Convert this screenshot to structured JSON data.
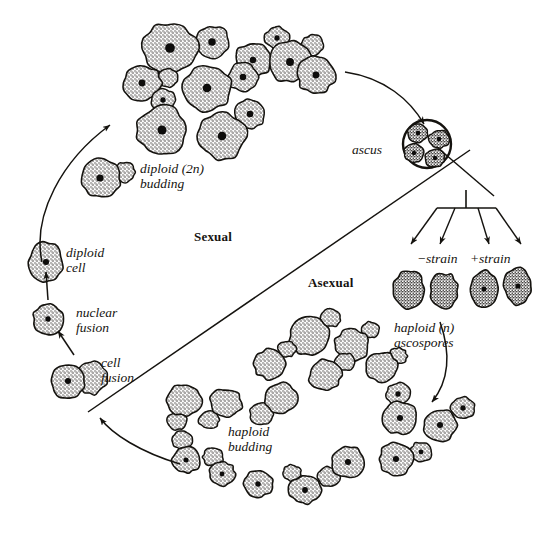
{
  "figure": {
    "background_color": "#ffffff",
    "ink_color": "#15130f",
    "cell_fill_color": "#c9c5bd",
    "nucleus_color": "#111111"
  },
  "labels": {
    "diploid_budding": "diploid (2n)\nbudding",
    "sexual": "Sexual",
    "asexual": "Asexual",
    "diploid_cell": "diploid\ncell",
    "nuclear_fusion": "nuclear\nfusion",
    "cell_fusion": "cell\nfusion",
    "ascus": "ascus",
    "minus_strain": "−strain",
    "plus_strain": "+strain",
    "haploid_ascospores": "haploid (n)\nascospores",
    "haploid_budding": "haploid\nbudding"
  },
  "label_positions": {
    "diploid_budding": {
      "x": 140,
      "y": 161
    },
    "sexual": {
      "x": 194,
      "y": 230
    },
    "asexual": {
      "x": 308,
      "y": 276
    },
    "diploid_cell": {
      "x": 66,
      "y": 245
    },
    "nuclear_fusion": {
      "x": 76,
      "y": 305
    },
    "cell_fusion": {
      "x": 101,
      "y": 355
    },
    "ascus": {
      "x": 352,
      "y": 142
    },
    "minus_strain": {
      "x": 417,
      "y": 251
    },
    "plus_strain": {
      "x": 470,
      "y": 251
    },
    "haploid_ascospores": {
      "x": 394,
      "y": 320
    },
    "haploid_budding": {
      "x": 228,
      "y": 424
    }
  },
  "divider": {
    "name": "sexual-asexual-divider",
    "from": {
      "x": 88,
      "y": 412
    },
    "to": {
      "x": 470,
      "y": 150
    }
  },
  "secondary_divider": {
    "name": "strain-divider-line",
    "from": {
      "x": 438,
      "y": 148
    },
    "to": {
      "x": 494,
      "y": 196
    }
  },
  "arrows": [
    {
      "name": "arrow-diploid-cell-to-diploid-budding",
      "d": "M 42 262 C 32 215 62 160 110 125",
      "direction": "up-right"
    },
    {
      "name": "arrow-nuclear-fusion-to-diploid-cell",
      "d": "M 48 300 L 46 272",
      "direction": "up"
    },
    {
      "name": "arrow-cell-fusion-to-nuclear-fusion",
      "d": "M 74 355 L 58 331",
      "direction": "up-left"
    },
    {
      "name": "arrow-diploid-cell-to-ascus",
      "d": "M 345 72 C 385 78 410 100 424 124",
      "direction": "down-right"
    },
    {
      "name": "arrow-haploid-budding-to-cell-fusion",
      "d": "M 180 464 C 140 452 112 434 100 418",
      "direction": "up-left"
    },
    {
      "name": "arrow-ascospores-to-haploid-budding",
      "d": "M 440 322 C 452 356 448 382 432 402",
      "direction": "down-left"
    }
  ],
  "spore_fan": {
    "name": "ascospore-release-bracket",
    "bar": {
      "x1": 437,
      "y1": 208,
      "x2": 496,
      "y2": 208
    },
    "stem": {
      "x1": 466,
      "y1": 208,
      "x2": 466,
      "y2": 190
    },
    "arrows": [
      {
        "name": "fan-arrow-1",
        "x1": 437,
        "y1": 208,
        "x2": 411,
        "y2": 244
      },
      {
        "name": "fan-arrow-2",
        "x1": 455,
        "y1": 208,
        "x2": 440,
        "y2": 244
      },
      {
        "name": "fan-arrow-3",
        "x1": 478,
        "y1": 208,
        "x2": 489,
        "y2": 244
      },
      {
        "name": "fan-arrow-4",
        "x1": 496,
        "y1": 208,
        "x2": 521,
        "y2": 244
      }
    ]
  },
  "cell_groups": {
    "diploid_budding_cluster": {
      "name": "diploid-budding-cells",
      "ploidy": "2n",
      "cells": [
        {
          "cx": 170,
          "cy": 48,
          "rx": 27,
          "ry": 25,
          "nucleus": true,
          "bud": {
            "cx": 212,
            "cy": 42,
            "rx": 17,
            "ry": 16,
            "nucleus": true
          }
        },
        {
          "cx": 253,
          "cy": 60,
          "rx": 18,
          "ry": 17,
          "nucleus": true,
          "bud": {
            "cx": 277,
            "cy": 38,
            "rx": 12,
            "ry": 11,
            "nucleus": true
          }
        },
        {
          "cx": 142,
          "cy": 83,
          "rx": 19,
          "ry": 18,
          "nucleus": true,
          "bud": {
            "cx": 168,
            "cy": 78,
            "rx": 10,
            "ry": 9,
            "nucleus": false
          }
        },
        {
          "cx": 207,
          "cy": 88,
          "rx": 24,
          "ry": 23,
          "nucleus": true,
          "bud": {
            "cx": 243,
            "cy": 77,
            "rx": 15,
            "ry": 14,
            "nucleus": true
          }
        },
        {
          "cx": 290,
          "cy": 62,
          "rx": 22,
          "ry": 20,
          "nucleus": true,
          "bud": {
            "cx": 313,
            "cy": 45,
            "rx": 11,
            "ry": 10,
            "nucleus": false
          }
        },
        {
          "cx": 162,
          "cy": 130,
          "rx": 25,
          "ry": 24,
          "nucleus": true,
          "bud": {
            "cx": 163,
            "cy": 100,
            "rx": 12,
            "ry": 11,
            "nucleus": true
          }
        },
        {
          "cx": 222,
          "cy": 136,
          "rx": 24,
          "ry": 23,
          "nucleus": true,
          "bud": {
            "cx": 250,
            "cy": 114,
            "rx": 15,
            "ry": 14,
            "nucleus": true
          }
        },
        {
          "cx": 100,
          "cy": 178,
          "rx": 20,
          "ry": 19,
          "nucleus": true,
          "bud": {
            "cx": 125,
            "cy": 172,
            "rx": 10,
            "ry": 10,
            "nucleus": false
          }
        }
      ]
    },
    "single_diploid_to_ascus": {
      "name": "diploid-cell-pre-meiosis",
      "cells": [
        {
          "cx": 316,
          "cy": 75,
          "rx": 19,
          "ry": 18,
          "nucleus": true
        }
      ]
    },
    "ascus": {
      "name": "ascus-with-ascospores",
      "cx": 427,
      "cy": 144,
      "r": 24,
      "spores": [
        {
          "cx": 418,
          "cy": 133,
          "rx": 10,
          "ry": 9
        },
        {
          "cx": 439,
          "cy": 139,
          "rx": 10,
          "ry": 9
        },
        {
          "cx": 414,
          "cy": 153,
          "rx": 10,
          "ry": 9
        },
        {
          "cx": 435,
          "cy": 158,
          "rx": 10,
          "ry": 9
        }
      ]
    },
    "ascospores_row": {
      "name": "haploid-ascospores",
      "ploidy": "n",
      "cells": [
        {
          "cx": 409,
          "cy": 289,
          "rx": 15,
          "ry": 19,
          "nucleus": false,
          "strain": "minus"
        },
        {
          "cx": 444,
          "cy": 291,
          "rx": 14,
          "ry": 18,
          "nucleus": false,
          "strain": "minus"
        },
        {
          "cx": 484,
          "cy": 289,
          "rx": 14,
          "ry": 18,
          "nucleus": true,
          "strain": "plus"
        },
        {
          "cx": 518,
          "cy": 286,
          "rx": 14,
          "ry": 18,
          "nucleus": true,
          "strain": "plus"
        }
      ]
    },
    "haploid_budding_cluster": {
      "name": "haploid-budding-cells",
      "ploidy": "n",
      "cells": [
        {
          "cx": 309,
          "cy": 336,
          "rx": 20,
          "ry": 19,
          "nucleus": false,
          "bud": {
            "cx": 331,
            "cy": 318,
            "rx": 10,
            "ry": 9,
            "nucleus": false
          }
        },
        {
          "cx": 352,
          "cy": 345,
          "rx": 17,
          "ry": 16,
          "nucleus": false,
          "bud": {
            "cx": 370,
            "cy": 330,
            "rx": 9,
            "ry": 8,
            "nucleus": false
          }
        },
        {
          "cx": 270,
          "cy": 364,
          "rx": 16,
          "ry": 15,
          "nucleus": false,
          "bud": {
            "cx": 287,
            "cy": 349,
            "rx": 9,
            "ry": 8,
            "nucleus": false
          }
        },
        {
          "cx": 325,
          "cy": 375,
          "rx": 16,
          "ry": 15,
          "nucleus": false,
          "bud": {
            "cx": 345,
            "cy": 362,
            "rx": 10,
            "ry": 9,
            "nucleus": false
          }
        },
        {
          "cx": 382,
          "cy": 367,
          "rx": 16,
          "ry": 15,
          "nucleus": false,
          "bud": {
            "cx": 398,
            "cy": 356,
            "rx": 9,
            "ry": 8,
            "nucleus": false
          }
        },
        {
          "cx": 184,
          "cy": 400,
          "rx": 17,
          "ry": 16,
          "nucleus": false,
          "bud": {
            "cx": 177,
            "cy": 421,
            "rx": 10,
            "ry": 9,
            "nucleus": false
          }
        },
        {
          "cx": 226,
          "cy": 403,
          "rx": 16,
          "ry": 14,
          "nucleus": false,
          "bud": {
            "cx": 209,
            "cy": 420,
            "rx": 10,
            "ry": 9,
            "nucleus": false
          }
        },
        {
          "cx": 281,
          "cy": 398,
          "rx": 16,
          "ry": 15,
          "nucleus": false,
          "bud": {
            "cx": 262,
            "cy": 414,
            "rx": 12,
            "ry": 11,
            "nucleus": false
          }
        },
        {
          "cx": 186,
          "cy": 460,
          "rx": 14,
          "ry": 13,
          "nucleus": true,
          "bud": {
            "cx": 182,
            "cy": 440,
            "rx": 10,
            "ry": 9,
            "nucleus": false
          }
        },
        {
          "cx": 222,
          "cy": 474,
          "rx": 13,
          "ry": 12,
          "nucleus": true,
          "bud": {
            "cx": 213,
            "cy": 457,
            "rx": 10,
            "ry": 9,
            "nucleus": false
          }
        },
        {
          "cx": 258,
          "cy": 484,
          "rx": 15,
          "ry": 13,
          "nucleus": true,
          "bud": null
        },
        {
          "cx": 305,
          "cy": 490,
          "rx": 16,
          "ry": 14,
          "nucleus": true,
          "bud": {
            "cx": 292,
            "cy": 473,
            "rx": 9,
            "ry": 8,
            "nucleus": false
          }
        },
        {
          "cx": 348,
          "cy": 462,
          "rx": 17,
          "ry": 15,
          "nucleus": true,
          "bud": {
            "cx": 329,
            "cy": 477,
            "rx": 11,
            "ry": 10,
            "nucleus": false
          }
        },
        {
          "cx": 396,
          "cy": 459,
          "rx": 17,
          "ry": 16,
          "nucleus": true,
          "bud": {
            "cx": 421,
            "cy": 452,
            "rx": 11,
            "ry": 10,
            "nucleus": true
          }
        },
        {
          "cx": 400,
          "cy": 418,
          "rx": 17,
          "ry": 16,
          "nucleus": true,
          "bud": {
            "cx": 398,
            "cy": 394,
            "rx": 12,
            "ry": 11,
            "nucleus": true
          }
        },
        {
          "cx": 440,
          "cy": 425,
          "rx": 17,
          "ry": 16,
          "nucleus": true,
          "bud": {
            "cx": 463,
            "cy": 408,
            "rx": 12,
            "ry": 11,
            "nucleus": true
          }
        }
      ]
    }
  }
}
